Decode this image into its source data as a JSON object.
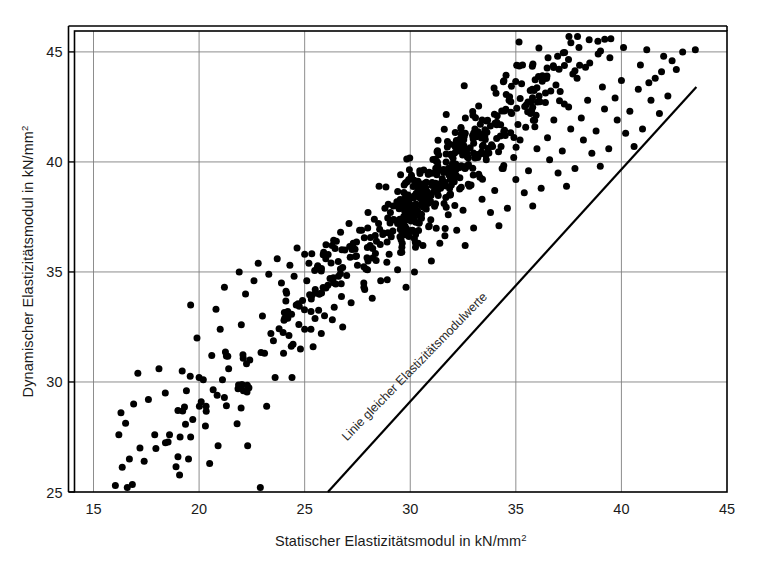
{
  "chart_data": {
    "type": "scatter",
    "title": "",
    "xlabel": "Statischer Elastizitätsmodul in kN/mm",
    "xlabel_sup": "2",
    "ylabel": "Dynamischer Elastizitätsmodul in kN/mm",
    "ylabel_sup": "2",
    "xlim": [
      14.1,
      45.0
    ],
    "ylim": [
      25.0,
      45.95
    ],
    "xticks": [
      15,
      20,
      25,
      30,
      35,
      40,
      45
    ],
    "yticks": [
      25,
      30,
      35,
      40,
      45
    ],
    "xtick_labels": [
      "15",
      "20",
      "25",
      "30",
      "35",
      "40",
      "45"
    ],
    "ytick_labels": [
      "25",
      "30",
      "35",
      "40",
      "45"
    ],
    "grid": true,
    "grid_color": "#808080",
    "frame_color": "#000000",
    "marker_color": "#000000",
    "marker_size": 4.4,
    "legend": "none",
    "annotations": [
      {
        "text": "Linie gleicher Elastizitätsmodulwerte",
        "type": "line-label",
        "rotation_deg": -45.6,
        "x_data": 27.0,
        "y_data": 27.3
      }
    ],
    "reference_line": {
      "name": "Linie gleicher Elastizitätsmodulwerte",
      "x_start": 26.1,
      "y_start": 25.0,
      "x_end": 43.55,
      "y_end": 43.4,
      "color": "#000000",
      "width": 2.2
    },
    "series": [
      {
        "name": "Messwerte",
        "marker": "filled-circle",
        "color": "#000000",
        "n_points": 712,
        "points": [
          [
            16.6,
            25.2
          ],
          [
            16.7,
            26.5
          ],
          [
            17.2,
            27.0
          ],
          [
            16.2,
            27.6
          ],
          [
            17.9,
            27.6
          ],
          [
            17.4,
            26.4
          ],
          [
            18.6,
            27.6
          ],
          [
            19.1,
            27.5
          ],
          [
            19.0,
            26.6
          ],
          [
            19.5,
            26.5
          ],
          [
            19.6,
            27.5
          ],
          [
            19.7,
            28.3
          ],
          [
            20.1,
            29.1
          ],
          [
            20.0,
            30.2
          ],
          [
            20.2,
            30.1
          ],
          [
            19.4,
            29.6
          ],
          [
            18.4,
            29.5
          ],
          [
            17.6,
            29.2
          ],
          [
            16.9,
            29.0
          ],
          [
            16.3,
            28.6
          ],
          [
            17.1,
            30.4
          ],
          [
            18.1,
            30.6
          ],
          [
            19.2,
            30.5
          ],
          [
            20.3,
            28.0
          ],
          [
            20.5,
            26.3
          ],
          [
            20.9,
            27.1
          ],
          [
            21.8,
            28.1
          ],
          [
            22.1,
            29.6
          ],
          [
            22.3,
            27.1
          ],
          [
            22.9,
            25.2
          ],
          [
            23.2,
            28.9
          ],
          [
            23.6,
            30.2
          ],
          [
            23.1,
            31.3
          ],
          [
            22.4,
            31.0
          ],
          [
            21.4,
            30.6
          ],
          [
            20.6,
            31.2
          ],
          [
            19.9,
            32.0
          ],
          [
            21.0,
            32.4
          ],
          [
            22.0,
            32.6
          ],
          [
            20.8,
            33.3
          ],
          [
            19.6,
            33.5
          ],
          [
            21.2,
            34.3
          ],
          [
            22.2,
            34.0
          ],
          [
            23.0,
            33.0
          ],
          [
            23.4,
            32.2
          ],
          [
            24.0,
            31.3
          ],
          [
            24.4,
            30.2
          ],
          [
            24.8,
            31.5
          ],
          [
            24.2,
            32.9
          ],
          [
            24.6,
            33.5
          ],
          [
            25.0,
            32.4
          ],
          [
            25.4,
            31.6
          ],
          [
            25.3,
            33.2
          ],
          [
            25.7,
            34.0
          ],
          [
            25.1,
            34.6
          ],
          [
            24.5,
            34.8
          ],
          [
            23.9,
            34.5
          ],
          [
            23.3,
            34.9
          ],
          [
            22.6,
            34.6
          ],
          [
            21.9,
            35.0
          ],
          [
            22.8,
            35.4
          ],
          [
            23.7,
            35.6
          ],
          [
            24.3,
            35.3
          ],
          [
            25.0,
            35.8
          ],
          [
            25.6,
            35.2
          ],
          [
            26.1,
            34.4
          ],
          [
            26.4,
            33.4
          ],
          [
            26.8,
            32.5
          ],
          [
            27.2,
            33.6
          ],
          [
            26.6,
            34.8
          ],
          [
            26.0,
            35.6
          ],
          [
            26.3,
            36.2
          ],
          [
            26.9,
            36.0
          ],
          [
            27.5,
            35.3
          ],
          [
            27.8,
            34.5
          ],
          [
            28.2,
            33.8
          ],
          [
            28.6,
            34.6
          ],
          [
            28.0,
            35.5
          ],
          [
            27.3,
            36.3
          ],
          [
            26.7,
            36.8
          ],
          [
            27.1,
            37.2
          ],
          [
            27.7,
            36.9
          ],
          [
            28.4,
            36.4
          ],
          [
            29.0,
            35.8
          ],
          [
            29.4,
            35.1
          ],
          [
            29.8,
            34.3
          ],
          [
            30.2,
            35.0
          ],
          [
            29.6,
            35.9
          ],
          [
            29.1,
            36.6
          ],
          [
            28.5,
            37.2
          ],
          [
            28.0,
            37.7
          ],
          [
            28.8,
            37.9
          ],
          [
            29.5,
            37.4
          ],
          [
            30.1,
            36.9
          ],
          [
            30.6,
            36.2
          ],
          [
            31.0,
            35.5
          ],
          [
            31.4,
            36.3
          ],
          [
            30.9,
            37.1
          ],
          [
            30.3,
            37.8
          ],
          [
            29.7,
            38.3
          ],
          [
            30.5,
            38.6
          ],
          [
            31.2,
            38.1
          ],
          [
            31.8,
            37.6
          ],
          [
            32.2,
            36.9
          ],
          [
            32.6,
            36.2
          ],
          [
            33.0,
            37.0
          ],
          [
            32.5,
            37.8
          ],
          [
            31.9,
            38.5
          ],
          [
            31.3,
            39.0
          ],
          [
            32.0,
            39.3
          ],
          [
            32.8,
            38.9
          ],
          [
            33.4,
            38.3
          ],
          [
            33.8,
            37.7
          ],
          [
            34.2,
            37.1
          ],
          [
            34.6,
            37.9
          ],
          [
            34.0,
            38.7
          ],
          [
            33.3,
            39.3
          ],
          [
            32.7,
            39.8
          ],
          [
            33.6,
            40.1
          ],
          [
            34.4,
            39.7
          ],
          [
            35.0,
            39.2
          ],
          [
            35.4,
            38.6
          ],
          [
            35.8,
            38.0
          ],
          [
            36.2,
            38.8
          ],
          [
            35.6,
            39.6
          ],
          [
            34.9,
            40.2
          ],
          [
            34.3,
            40.7
          ],
          [
            35.2,
            41.0
          ],
          [
            36.0,
            40.6
          ],
          [
            36.6,
            40.1
          ],
          [
            37.0,
            39.5
          ],
          [
            37.4,
            38.9
          ],
          [
            37.8,
            39.7
          ],
          [
            37.2,
            40.5
          ],
          [
            36.5,
            41.1
          ],
          [
            35.9,
            41.6
          ],
          [
            36.8,
            41.9
          ],
          [
            37.6,
            41.5
          ],
          [
            38.2,
            41.0
          ],
          [
            38.6,
            40.4
          ],
          [
            39.0,
            39.8
          ],
          [
            39.4,
            40.6
          ],
          [
            38.8,
            41.4
          ],
          [
            38.1,
            42.0
          ],
          [
            37.5,
            42.5
          ],
          [
            38.4,
            42.8
          ],
          [
            39.2,
            42.4
          ],
          [
            39.8,
            41.9
          ],
          [
            40.2,
            41.3
          ],
          [
            40.6,
            40.7
          ],
          [
            41.0,
            41.5
          ],
          [
            40.4,
            42.3
          ],
          [
            39.7,
            42.9
          ],
          [
            39.1,
            43.4
          ],
          [
            40.0,
            43.7
          ],
          [
            40.8,
            43.3
          ],
          [
            41.4,
            42.8
          ],
          [
            41.8,
            42.2
          ],
          [
            42.2,
            43.0
          ],
          [
            41.6,
            43.8
          ],
          [
            40.9,
            44.4
          ],
          [
            41.2,
            45.1
          ],
          [
            42.0,
            44.8
          ],
          [
            42.6,
            44.2
          ],
          [
            39.5,
            45.6
          ],
          [
            40.1,
            45.2
          ],
          [
            38.9,
            44.9
          ],
          [
            38.3,
            44.3
          ],
          [
            37.9,
            43.8
          ],
          [
            37.1,
            43.2
          ],
          [
            36.4,
            42.7
          ],
          [
            35.7,
            42.2
          ],
          [
            35.1,
            41.7
          ],
          [
            34.5,
            41.2
          ],
          [
            33.9,
            40.7
          ],
          [
            33.2,
            40.2
          ],
          [
            32.6,
            39.7
          ],
          [
            31.9,
            39.2
          ],
          [
            31.3,
            38.7
          ],
          [
            30.7,
            38.2
          ],
          [
            30.0,
            37.7
          ],
          [
            29.4,
            37.2
          ],
          [
            28.7,
            36.7
          ],
          [
            28.1,
            36.2
          ],
          [
            27.4,
            35.7
          ],
          [
            26.8,
            35.2
          ],
          [
            26.2,
            34.7
          ],
          [
            25.5,
            34.2
          ],
          [
            24.9,
            33.7
          ],
          [
            24.2,
            33.2
          ],
          [
            33.5,
            41.3
          ],
          [
            34.1,
            41.8
          ],
          [
            34.8,
            42.2
          ],
          [
            35.5,
            42.6
          ],
          [
            36.1,
            43.0
          ],
          [
            36.9,
            43.5
          ],
          [
            37.7,
            44.0
          ],
          [
            38.5,
            44.5
          ],
          [
            43.5,
            45.1
          ],
          [
            42.9,
            45.0
          ],
          [
            42.4,
            44.6
          ],
          [
            41.9,
            44.1
          ],
          [
            41.3,
            43.6
          ],
          [
            30.4,
            39.0
          ],
          [
            31.1,
            39.5
          ],
          [
            31.7,
            40.0
          ],
          [
            32.3,
            40.5
          ],
          [
            29.9,
            38.5
          ],
          [
            29.2,
            38.0
          ],
          [
            28.3,
            37.4
          ],
          [
            27.6,
            36.9
          ],
          [
            26.5,
            36.4
          ],
          [
            25.9,
            35.9
          ],
          [
            25.2,
            35.4
          ]
        ]
      }
    ]
  },
  "figure": {
    "background": "#ffffff",
    "width": 763,
    "height": 563
  }
}
